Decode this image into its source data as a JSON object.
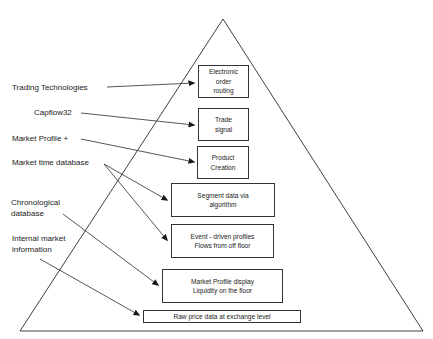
{
  "diagram": {
    "type": "pyramid",
    "levels": [
      {
        "id": "electronic-order-routing",
        "lines": [
          "Electronic",
          "order",
          "routing"
        ],
        "box": [
          198,
          65,
          51,
          33
        ]
      },
      {
        "id": "trade-signal",
        "lines": [
          "Trade",
          "signal"
        ],
        "box": [
          198,
          108,
          51,
          33
        ]
      },
      {
        "id": "product-creation",
        "lines": [
          "Product",
          "Creation"
        ],
        "box": [
          197,
          146,
          52,
          33
        ]
      },
      {
        "id": "segment-data",
        "lines": [
          "Segment data via",
          "algorithm"
        ],
        "box": [
          171,
          183,
          104,
          34
        ]
      },
      {
        "id": "event-driven-profiles",
        "lines": [
          "Event - driven profiles",
          "Flows from off floor"
        ],
        "box": [
          171,
          224,
          103,
          34
        ]
      },
      {
        "id": "market-profile-display",
        "lines": [
          "Market Profile display",
          "Liquidity on the floor"
        ],
        "box": [
          162,
          269,
          121,
          34
        ]
      },
      {
        "id": "raw-price-data",
        "lines": [
          "Raw price data at exchange level"
        ],
        "box": [
          143,
          310,
          158,
          13
        ]
      }
    ],
    "sources": [
      {
        "id": "trading-technologies",
        "lines": [
          "Trading Technologies"
        ],
        "pos": [
          12,
          82
        ],
        "targets": [
          "electronic-order-routing"
        ]
      },
      {
        "id": "capflow32",
        "lines": [
          "Capflow32"
        ],
        "pos": [
          34,
          107
        ],
        "targets": [
          "trade-signal"
        ]
      },
      {
        "id": "market-profile-plus",
        "lines": [
          "Market Profile +"
        ],
        "pos": [
          12,
          133
        ],
        "targets": [
          "product-creation"
        ]
      },
      {
        "id": "market-time-database",
        "lines": [
          "Market time database"
        ],
        "pos": [
          12,
          157
        ],
        "targets": [
          "segment-data",
          "event-driven-profiles"
        ]
      },
      {
        "id": "chronological-database",
        "lines": [
          "Chronological",
          "database"
        ],
        "pos": [
          11,
          197
        ],
        "targets": [
          "market-profile-display"
        ]
      },
      {
        "id": "internal-market-information",
        "lines": [
          "Internal market",
          "information"
        ],
        "pos": [
          12,
          233
        ],
        "targets": [
          "raw-price-data"
        ]
      }
    ],
    "arrows": [
      {
        "from": "trading-technologies",
        "to": "electronic-order-routing",
        "points": [
          [
            107,
            87
          ],
          [
            194,
            83
          ]
        ]
      },
      {
        "from": "capflow32",
        "to": "trade-signal",
        "points": [
          [
            81,
            113
          ],
          [
            194,
            125
          ]
        ]
      },
      {
        "from": "market-profile-plus",
        "to": "product-creation",
        "points": [
          [
            81,
            139
          ],
          [
            194,
            162
          ]
        ]
      },
      {
        "from": "market-time-database",
        "to": "segment-data",
        "points": [
          [
            104,
            164
          ],
          [
            167,
            200
          ]
        ]
      },
      {
        "from": "market-time-database",
        "to": "event-driven-profiles",
        "points": [
          [
            104,
            164
          ],
          [
            167,
            240
          ]
        ]
      },
      {
        "from": "chronological-database",
        "to": "market-profile-display",
        "points": [
          [
            63,
            214
          ],
          [
            158,
            285
          ]
        ]
      },
      {
        "from": "internal-market-information",
        "to": "raw-price-data",
        "points": [
          [
            40,
            259
          ],
          [
            139,
            315
          ]
        ]
      }
    ],
    "triangle": {
      "apex": [
        223,
        19
      ],
      "base_left": [
        20,
        331
      ],
      "base_right": [
        423,
        331
      ]
    },
    "colors": {
      "line": "#2a2a2a",
      "box_border": "#333333",
      "text": "#222222",
      "background": "#ffffff"
    }
  }
}
